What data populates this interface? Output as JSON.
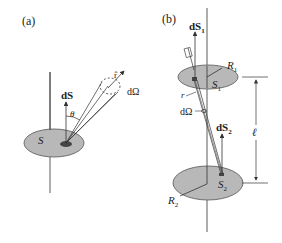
{
  "panel_a": {
    "label": "(a)",
    "surface_label": "S",
    "area_element_label": "dS",
    "angle_label": "θ",
    "unit_vector_label": "r̂",
    "solid_angle_label": "dΩ"
  },
  "panel_b": {
    "label": "(b)",
    "area_element_1_label": "dS",
    "area_element_1_sub": "1",
    "area_element_2_label": "dS",
    "area_element_2_sub": "2",
    "surface_1_label": "S",
    "surface_1_sub": "1",
    "surface_2_label": "S",
    "surface_2_sub": "2",
    "radius_1_label": "R",
    "radius_1_sub": "1",
    "radius_2_label": "R",
    "radius_2_sub": "2",
    "unit_vector_label": "r̂",
    "distance_label": "r",
    "solid_angle_label": "dΩ",
    "separation_label": "ℓ"
  },
  "colors": {
    "disk_fill": "#b8b8b8",
    "disk_stroke": "#555555",
    "patch_fill": "#444444",
    "line": "#333333"
  }
}
